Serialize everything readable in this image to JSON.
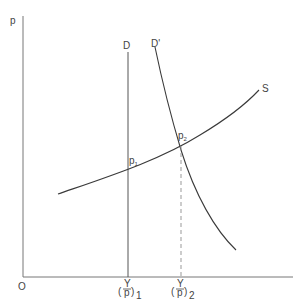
{
  "diagram": {
    "type": "supply-demand",
    "axes": {
      "y_label": "p",
      "origin_label": "O"
    },
    "curves": {
      "demand": {
        "label": "D"
      },
      "demand_shifted": {
        "label": "D'"
      },
      "supply": {
        "label": "S"
      }
    },
    "points": {
      "p1": {
        "label": "p",
        "subscript": "1"
      },
      "p2": {
        "label": "p",
        "subscript": "2"
      }
    },
    "x_ticks": {
      "tick1": {
        "numerator": "Y",
        "denominator": "p",
        "subscript": "1"
      },
      "tick2": {
        "numerator": "Y",
        "denominator": "p",
        "subscript": "2"
      }
    },
    "colors": {
      "line": "#3a3a3a",
      "axis": "#777777",
      "dashed": "#999999"
    }
  }
}
